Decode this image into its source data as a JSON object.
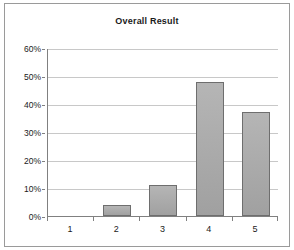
{
  "chart_data": {
    "type": "bar",
    "title": "Overall Result",
    "xlabel": "",
    "ylabel": "",
    "categories": [
      "1",
      "2",
      "3",
      "4",
      "5"
    ],
    "values": [
      0,
      4,
      11,
      48,
      37
    ],
    "value_labels": [
      "0%",
      "4%",
      "11%",
      "48%",
      "37%"
    ],
    "ylim": [
      0,
      60
    ],
    "ytick_labels": [
      "0%",
      "10%",
      "20%",
      "30%",
      "40%",
      "50%",
      "60%"
    ],
    "ytick_values": [
      0,
      10,
      20,
      30,
      40,
      50,
      60
    ],
    "grid": true,
    "legend": false,
    "legend_position": "none",
    "colors": {
      "bar_fill": "#a9a9a9",
      "bar_border": "#6e6e6e",
      "gridline": "#c8c8c8",
      "axis": "#808080",
      "frame": "#9a9a9a",
      "plot_background": "#ffffff",
      "text": "#1a1a1a"
    }
  }
}
